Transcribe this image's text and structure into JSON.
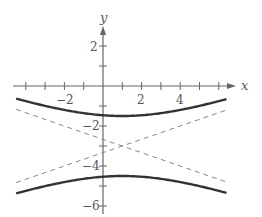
{
  "chart_data": {
    "type": "line",
    "title": "",
    "xlabel": "x",
    "ylabel": "y",
    "xlim": [
      -4.6,
      6.9
    ],
    "ylim": [
      -6.4,
      3
    ],
    "grid": false,
    "x_ticks": [
      -4,
      -3,
      -2,
      -1,
      1,
      2,
      3,
      4,
      5,
      6
    ],
    "x_tick_labels": [
      "-2",
      "2",
      "4"
    ],
    "y_ticks": [
      2,
      1,
      -1,
      -2,
      -3,
      -4,
      -5,
      -6
    ],
    "y_tick_labels": [
      "2",
      "-2",
      "-4",
      "-6"
    ],
    "equation": "(y+3)^2/2.25 - (x-1)^2/20.25 = 1",
    "center": [
      1,
      -3
    ],
    "vertices": [
      [
        1,
        -1.5
      ],
      [
        1,
        -4.5
      ]
    ],
    "series": [
      {
        "name": "upper branch",
        "style": "solid",
        "x_range": [
          -4.5,
          6.4
        ]
      },
      {
        "name": "lower branch",
        "style": "solid",
        "x_range": [
          -4.5,
          6.4
        ]
      },
      {
        "name": "asymptote y+3 = (x-1)/3",
        "style": "dashed",
        "points": [
          [
            -4.5,
            -4.83
          ],
          [
            6.4,
            -1.2
          ]
        ]
      },
      {
        "name": "asymptote y+3 = -(x-1)/3",
        "style": "dashed",
        "points": [
          [
            -4.5,
            -1.17
          ],
          [
            6.4,
            -4.8
          ]
        ]
      }
    ]
  },
  "labels": {
    "x_axis": "x",
    "y_axis": "y",
    "tick_x_neg2": "−2",
    "tick_x_2": "2",
    "tick_x_4": "4",
    "tick_y_2": "2",
    "tick_y_neg2": "−2",
    "tick_y_neg4": "−4",
    "tick_y_neg6": "−6"
  }
}
